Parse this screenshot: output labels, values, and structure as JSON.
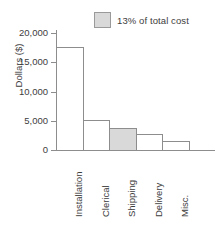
{
  "chart_data": {
    "type": "bar",
    "title": "",
    "subtitle": "",
    "xlabel": "",
    "ylabel": "Dollars ($)",
    "ylim": [
      0,
      20000
    ],
    "yticks": [
      0,
      5000,
      10000,
      15000,
      20000
    ],
    "ytick_labels": [
      "0",
      "5,000",
      "10,000",
      "15,000",
      "20,000"
    ],
    "grid": false,
    "bar_gap": "none",
    "categories": [
      "Installation",
      "Clerical",
      "Shipping",
      "Delivery",
      "Misc."
    ],
    "values": [
      17600,
      5200,
      3800,
      2700,
      1500
    ],
    "highlighted_category": "Shipping",
    "legend": {
      "position": "top-right",
      "entries": [
        {
          "label": "13% of total cost",
          "swatch_color": "#d9d9d9",
          "swatch_border": "#9a9a9a"
        }
      ]
    },
    "colors": {
      "bar_fill": "#ffffff",
      "bar_border": "#8d8d8d",
      "highlight_fill": "#d9d9d9",
      "axis": "#8d8d8d",
      "text": "#3d3d3d",
      "background": "#ffffff"
    }
  }
}
